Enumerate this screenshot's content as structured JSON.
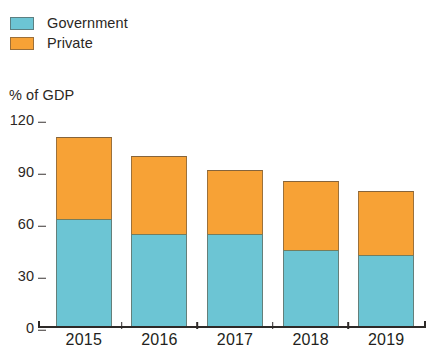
{
  "chart_data": {
    "type": "bar",
    "subtype": "stacked-bar",
    "title": "",
    "subtitle": "",
    "ylabel": "% of GDP",
    "xlabel": "",
    "categories": [
      "2015",
      "2016",
      "2017",
      "2018",
      "2019"
    ],
    "series": [
      {
        "name": "Government",
        "color": "#6cc5d4",
        "values": [
          63,
          54,
          54,
          45,
          42
        ]
      },
      {
        "name": "Private",
        "color": "#f7a236",
        "values": [
          47,
          45,
          37,
          40,
          37
        ]
      }
    ],
    "totals": [
      110,
      99,
      91,
      85,
      79
    ],
    "ylim": [
      0,
      120
    ],
    "yticks": [
      0,
      30,
      60,
      90,
      120
    ],
    "ytick_labels": [
      "0",
      "30",
      "60",
      "90",
      "120"
    ],
    "grid": false,
    "legend_position": "top-left",
    "legend": [
      {
        "label": "Government",
        "color": "#6cc5d4"
      },
      {
        "label": "Private",
        "color": "#f7a236"
      }
    ]
  },
  "legend": {
    "items": [
      {
        "label": "Government",
        "swatch_name": "legend-swatch-government"
      },
      {
        "label": "Private",
        "swatch_name": "legend-swatch-private"
      }
    ]
  },
  "axes": {
    "y_title": "% of GDP",
    "y_tick_labels": [
      "120",
      "90",
      "60",
      "30",
      "0"
    ],
    "x_tick_labels": [
      "2015",
      "2016",
      "2017",
      "2018",
      "2019"
    ]
  },
  "colors": {
    "government": "#6cc5d4",
    "private": "#f7a236",
    "axis": "#2e2a28",
    "text": "#231f20",
    "background": "#ffffff"
  }
}
